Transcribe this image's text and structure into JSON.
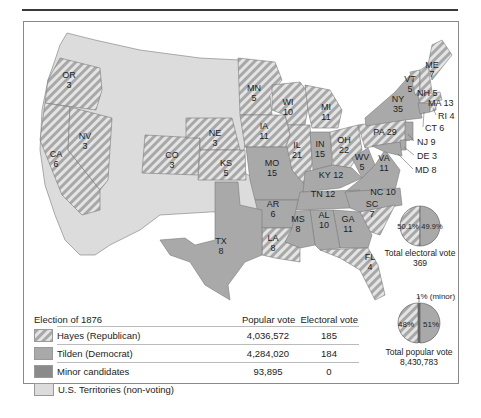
{
  "colors": {
    "republican_stripe": "#a8a8a8",
    "democrat": "#a9a9a9",
    "minor": "#8a8a8a",
    "territory": "#dcdcdc",
    "border": "#8a8a8a"
  },
  "map": {
    "title": "Election of 1876",
    "states": [
      {
        "abbr": "OR",
        "ev": "3",
        "party": "Hayes"
      },
      {
        "abbr": "CA",
        "ev": "6",
        "party": "Hayes"
      },
      {
        "abbr": "NV",
        "ev": "3",
        "party": "Hayes"
      },
      {
        "abbr": "CO",
        "ev": "3",
        "party": "Hayes"
      },
      {
        "abbr": "NE",
        "ev": "3",
        "party": "Hayes"
      },
      {
        "abbr": "KS",
        "ev": "5",
        "party": "Hayes"
      },
      {
        "abbr": "MN",
        "ev": "5",
        "party": "Hayes"
      },
      {
        "abbr": "IA",
        "ev": "11",
        "party": "Hayes"
      },
      {
        "abbr": "WI",
        "ev": "10",
        "party": "Hayes"
      },
      {
        "abbr": "IL",
        "ev": "21",
        "party": "Hayes"
      },
      {
        "abbr": "MI",
        "ev": "11",
        "party": "Hayes"
      },
      {
        "abbr": "OH",
        "ev": "22",
        "party": "Hayes"
      },
      {
        "abbr": "PA",
        "ev": "29",
        "party": "Hayes"
      },
      {
        "abbr": "VT",
        "ev": "5",
        "party": "Hayes"
      },
      {
        "abbr": "NH",
        "ev": "5",
        "party": "Hayes"
      },
      {
        "abbr": "ME",
        "ev": "7",
        "party": "Hayes"
      },
      {
        "abbr": "MA",
        "ev": "13",
        "party": "Hayes"
      },
      {
        "abbr": "RI",
        "ev": "4",
        "party": "Hayes"
      },
      {
        "abbr": "SC",
        "ev": "7",
        "party": "Hayes"
      },
      {
        "abbr": "LA",
        "ev": "8",
        "party": "Hayes"
      },
      {
        "abbr": "FL",
        "ev": "4",
        "party": "Hayes"
      },
      {
        "abbr": "MO",
        "ev": "15",
        "party": "Tilden"
      },
      {
        "abbr": "IN",
        "ev": "15",
        "party": "Tilden"
      },
      {
        "abbr": "KY",
        "ev": "12",
        "party": "Tilden"
      },
      {
        "abbr": "WV",
        "ev": "5",
        "party": "Tilden"
      },
      {
        "abbr": "VA",
        "ev": "11",
        "party": "Tilden"
      },
      {
        "abbr": "NC",
        "ev": "10",
        "party": "Tilden"
      },
      {
        "abbr": "TN",
        "ev": "12",
        "party": "Tilden"
      },
      {
        "abbr": "AR",
        "ev": "6",
        "party": "Tilden"
      },
      {
        "abbr": "TX",
        "ev": "8",
        "party": "Tilden"
      },
      {
        "abbr": "MS",
        "ev": "8",
        "party": "Tilden"
      },
      {
        "abbr": "AL",
        "ev": "10",
        "party": "Tilden"
      },
      {
        "abbr": "GA",
        "ev": "11",
        "party": "Tilden"
      },
      {
        "abbr": "NY",
        "ev": "35",
        "party": "Tilden"
      },
      {
        "abbr": "CT",
        "ev": "6",
        "party": "Tilden"
      },
      {
        "abbr": "NJ",
        "ev": "9",
        "party": "Tilden"
      },
      {
        "abbr": "DE",
        "ev": "3",
        "party": "Tilden"
      },
      {
        "abbr": "MD",
        "ev": "8",
        "party": "Tilden"
      }
    ],
    "labels": {
      "OR": "OR",
      "OR_ev": "3",
      "CA": "CA",
      "CA_ev": "6",
      "NV": "NV",
      "NV_ev": "3",
      "CO": "CO",
      "CO_ev": "3",
      "NE": "NE",
      "NE_ev": "3",
      "KS": "KS",
      "KS_ev": "5",
      "MN": "MN",
      "MN_ev": "5",
      "IA": "IA",
      "IA_ev": "11",
      "WI": "WI",
      "WI_ev": "10",
      "IL": "IL",
      "IL_ev": "21",
      "MI": "MI",
      "MI_ev": "11",
      "IN": "IN",
      "IN_ev": "15",
      "OH": "OH",
      "OH_ev": "22",
      "MO": "MO",
      "MO_ev": "15",
      "KY": "KY 12",
      "WV": "WV",
      "WV_ev": "5",
      "VA": "VA",
      "VA_ev": "11",
      "NC": "NC 10",
      "TN": "TN 12",
      "AR": "AR",
      "AR_ev": "6",
      "TX": "TX",
      "TX_ev": "8",
      "LA": "LA",
      "LA_ev": "8",
      "MS": "MS",
      "MS_ev": "8",
      "AL": "AL",
      "AL_ev": "10",
      "GA": "GA",
      "GA_ev": "11",
      "SC": "SC",
      "SC_ev": "7",
      "FL": "FL",
      "FL_ev": "4",
      "PA": "PA 29",
      "NY": "NY",
      "NY_ev": "35",
      "VT": "VT",
      "VT_ev": "5",
      "NH": "NH 5",
      "ME": "ME",
      "ME_ev": "7",
      "MA": "MA 13",
      "RI": "RI 4",
      "CT": "CT 6",
      "NJ": "NJ 9",
      "DE": "DE 3",
      "MD": "MD 8"
    }
  },
  "pies": {
    "electoral": {
      "hayes_pct": "50.1%",
      "tilden_pct": "49.9%",
      "caption": "Total electoral vote",
      "total": "369"
    },
    "popular": {
      "minor_note": "1% (minor)",
      "hayes_pct": "48%",
      "tilden_pct": "51%",
      "caption": "Total popular vote",
      "total": "8,430,783"
    }
  },
  "legend": {
    "title": "Election of 1876",
    "col_popular": "Popular vote",
    "col_electoral": "Electoral vote",
    "rows": [
      {
        "name": "Hayes (Republican)",
        "popular": "4,036,572",
        "electoral": "185"
      },
      {
        "name": "Tilden (Democrat)",
        "popular": "4,284,020",
        "electoral": "184"
      },
      {
        "name": "Minor candidates",
        "popular": "93,895",
        "electoral": "0"
      },
      {
        "name": "U.S. Territories (non-voting)",
        "popular": "",
        "electoral": ""
      }
    ]
  }
}
